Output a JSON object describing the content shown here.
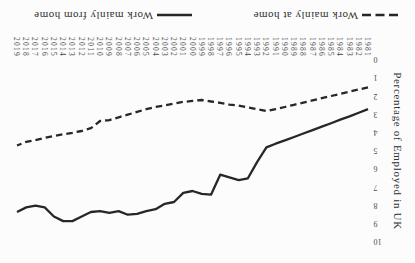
{
  "figure": {
    "orientation_note": "figure shown rotated 180 degrees",
    "colors": {
      "line": "#272727",
      "text": "#3b3b3b",
      "background": "#fcfcfc"
    }
  },
  "chart_data": {
    "type": "line",
    "title": "",
    "xlabel": "",
    "ylabel": "Percentage of Employed in UK",
    "ylim": [
      0,
      10
    ],
    "yticks": [
      0,
      1,
      2,
      3,
      4,
      5,
      6,
      7,
      8,
      9,
      10
    ],
    "grid": false,
    "legend_position": "bottom",
    "x": [
      1981,
      1982,
      1983,
      1984,
      1985,
      1986,
      1987,
      1988,
      1989,
      1990,
      1991,
      1992,
      1993,
      1994,
      1995,
      1996,
      1997,
      1998,
      1999,
      2000,
      2001,
      2002,
      2003,
      2004,
      2005,
      2006,
      2007,
      2008,
      2009,
      2010,
      2011,
      2012,
      2013,
      2014,
      2015,
      2016,
      2017,
      2018,
      2019
    ],
    "series": [
      {
        "name": "Work mainly at home",
        "style": "dashed",
        "values": [
          1.5,
          1.62,
          1.74,
          1.86,
          1.98,
          2.1,
          2.22,
          2.34,
          2.46,
          2.58,
          2.7,
          2.8,
          2.7,
          2.6,
          2.5,
          2.45,
          2.35,
          2.28,
          2.2,
          2.25,
          2.3,
          2.4,
          2.5,
          2.58,
          2.7,
          2.85,
          3.0,
          3.15,
          3.3,
          3.35,
          3.75,
          3.9,
          4.0,
          4.08,
          4.18,
          4.28,
          4.4,
          4.5,
          4.7
        ]
      },
      {
        "name": "Work mainly from home",
        "style": "solid",
        "values": [
          2.7,
          2.9,
          3.1,
          3.28,
          3.47,
          3.66,
          3.85,
          4.04,
          4.23,
          4.42,
          4.6,
          4.8,
          5.6,
          6.5,
          6.6,
          6.45,
          6.3,
          7.4,
          7.35,
          7.2,
          7.3,
          7.8,
          7.9,
          8.2,
          8.3,
          8.45,
          8.5,
          8.3,
          8.4,
          8.3,
          8.35,
          8.6,
          8.85,
          8.85,
          8.6,
          8.1,
          8.0,
          8.1,
          8.35
        ]
      }
    ]
  }
}
